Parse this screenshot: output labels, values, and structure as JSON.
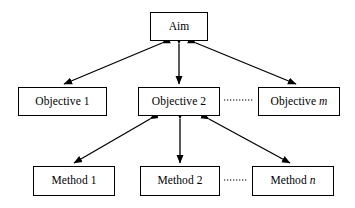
{
  "diagram": {
    "background_color": "#ffffff",
    "line_color": "#000000",
    "nodes": {
      "aim": {
        "label": "Aim",
        "variable": ""
      },
      "objective_1": {
        "label": "Objective 1",
        "variable": ""
      },
      "objective_2": {
        "label": "Objective 2",
        "variable": ""
      },
      "objective_m": {
        "label": "Objective ",
        "variable": "m"
      },
      "method_1": {
        "label": "Method 1",
        "variable": ""
      },
      "method_2": {
        "label": "Method 2",
        "variable": ""
      },
      "method_n": {
        "label": "Method ",
        "variable": "n"
      }
    },
    "connectors": [
      {
        "name": "aim-to-objective-1",
        "from": "aim",
        "to": "objective_1",
        "style": "double-arrow",
        "line": "solid"
      },
      {
        "name": "aim-to-objective-2",
        "from": "aim",
        "to": "objective_2",
        "style": "double-arrow",
        "line": "solid"
      },
      {
        "name": "aim-to-objective-m",
        "from": "aim",
        "to": "objective_m",
        "style": "double-arrow",
        "line": "solid"
      },
      {
        "name": "objective-2-to-method-1",
        "from": "objective_2",
        "to": "method_1",
        "style": "double-arrow",
        "line": "solid"
      },
      {
        "name": "objective-2-to-method-2",
        "from": "objective_2",
        "to": "method_2",
        "style": "double-arrow",
        "line": "solid"
      },
      {
        "name": "objective-2-to-method-n",
        "from": "objective_2",
        "to": "method_n",
        "style": "double-arrow",
        "line": "solid"
      },
      {
        "name": "objective-continuation",
        "from": "objective_2",
        "to": "objective_m",
        "style": "none",
        "line": "dotted"
      },
      {
        "name": "method-continuation",
        "from": "method_2",
        "to": "method_n",
        "style": "none",
        "line": "dotted"
      }
    ]
  }
}
